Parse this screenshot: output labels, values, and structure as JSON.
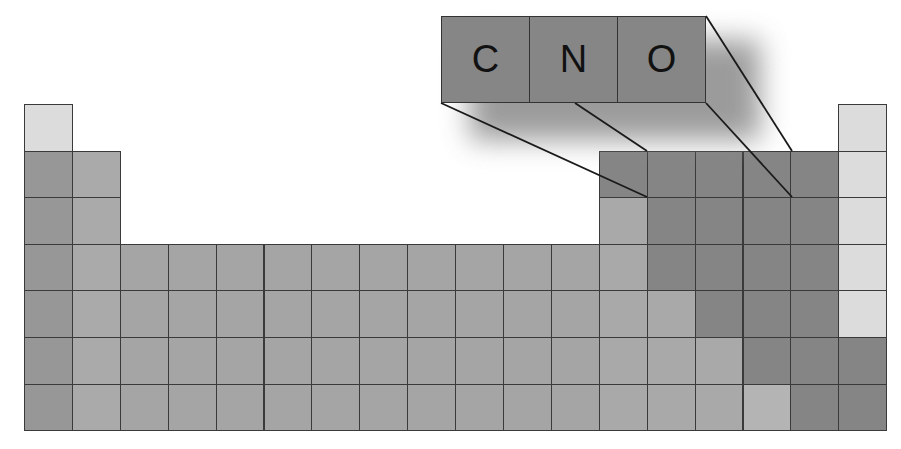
{
  "diagram": {
    "title": "",
    "colors": {
      "light": "#dcdcdc",
      "alkali": "#979797",
      "alkaline_earth": "#aaaaaa",
      "transition": "#a5a5a5",
      "medium": "#a9a9a9",
      "dark": "#858585",
      "callout": "#868686"
    },
    "grid": {
      "left": 24,
      "top_row1": 104,
      "col_width": 47.9,
      "row_height": 46.6,
      "rows": 7,
      "cols": 18
    },
    "cells": [
      {
        "r": 1,
        "c": 1,
        "shade": "light"
      },
      {
        "r": 1,
        "c": 18,
        "shade": "light"
      },
      {
        "r": 2,
        "c": 1,
        "shade": "alkali"
      },
      {
        "r": 2,
        "c": 2,
        "shade": "alkaline_earth"
      },
      {
        "r": 2,
        "c": 13,
        "shade": "dark"
      },
      {
        "r": 2,
        "c": 14,
        "shade": "dark"
      },
      {
        "r": 2,
        "c": 15,
        "shade": "dark"
      },
      {
        "r": 2,
        "c": 16,
        "shade": "dark"
      },
      {
        "r": 2,
        "c": 17,
        "shade": "dark"
      },
      {
        "r": 2,
        "c": 18,
        "shade": "light"
      },
      {
        "r": 3,
        "c": 1,
        "shade": "alkali"
      },
      {
        "r": 3,
        "c": 2,
        "shade": "alkaline_earth"
      },
      {
        "r": 3,
        "c": 13,
        "shade": "medium"
      },
      {
        "r": 3,
        "c": 14,
        "shade": "dark"
      },
      {
        "r": 3,
        "c": 15,
        "shade": "dark"
      },
      {
        "r": 3,
        "c": 16,
        "shade": "dark"
      },
      {
        "r": 3,
        "c": 17,
        "shade": "dark"
      },
      {
        "r": 3,
        "c": 18,
        "shade": "light"
      },
      {
        "r": 4,
        "c": 1,
        "shade": "alkali"
      },
      {
        "r": 4,
        "c": 2,
        "shade": "alkaline_earth"
      },
      {
        "r": 4,
        "c": 3,
        "shade": "transition"
      },
      {
        "r": 4,
        "c": 4,
        "shade": "transition"
      },
      {
        "r": 4,
        "c": 5,
        "shade": "transition"
      },
      {
        "r": 4,
        "c": 6,
        "shade": "transition"
      },
      {
        "r": 4,
        "c": 7,
        "shade": "transition"
      },
      {
        "r": 4,
        "c": 8,
        "shade": "transition"
      },
      {
        "r": 4,
        "c": 9,
        "shade": "transition"
      },
      {
        "r": 4,
        "c": 10,
        "shade": "transition"
      },
      {
        "r": 4,
        "c": 11,
        "shade": "transition"
      },
      {
        "r": 4,
        "c": 12,
        "shade": "transition"
      },
      {
        "r": 4,
        "c": 13,
        "shade": "medium"
      },
      {
        "r": 4,
        "c": 14,
        "shade": "dark"
      },
      {
        "r": 4,
        "c": 15,
        "shade": "dark"
      },
      {
        "r": 4,
        "c": 16,
        "shade": "dark"
      },
      {
        "r": 4,
        "c": 17,
        "shade": "dark"
      },
      {
        "r": 4,
        "c": 18,
        "shade": "light"
      },
      {
        "r": 5,
        "c": 1,
        "shade": "alkali"
      },
      {
        "r": 5,
        "c": 2,
        "shade": "alkaline_earth"
      },
      {
        "r": 5,
        "c": 3,
        "shade": "transition"
      },
      {
        "r": 5,
        "c": 4,
        "shade": "transition"
      },
      {
        "r": 5,
        "c": 5,
        "shade": "transition"
      },
      {
        "r": 5,
        "c": 6,
        "shade": "transition"
      },
      {
        "r": 5,
        "c": 7,
        "shade": "transition"
      },
      {
        "r": 5,
        "c": 8,
        "shade": "transition"
      },
      {
        "r": 5,
        "c": 9,
        "shade": "transition"
      },
      {
        "r": 5,
        "c": 10,
        "shade": "transition"
      },
      {
        "r": 5,
        "c": 11,
        "shade": "transition"
      },
      {
        "r": 5,
        "c": 12,
        "shade": "transition"
      },
      {
        "r": 5,
        "c": 13,
        "shade": "medium"
      },
      {
        "r": 5,
        "c": 14,
        "shade": "medium"
      },
      {
        "r": 5,
        "c": 15,
        "shade": "dark"
      },
      {
        "r": 5,
        "c": 16,
        "shade": "dark"
      },
      {
        "r": 5,
        "c": 17,
        "shade": "dark"
      },
      {
        "r": 5,
        "c": 18,
        "shade": "light"
      },
      {
        "r": 6,
        "c": 1,
        "shade": "alkali"
      },
      {
        "r": 6,
        "c": 2,
        "shade": "alkaline_earth"
      },
      {
        "r": 6,
        "c": 3,
        "shade": "transition"
      },
      {
        "r": 6,
        "c": 4,
        "shade": "transition"
      },
      {
        "r": 6,
        "c": 5,
        "shade": "transition"
      },
      {
        "r": 6,
        "c": 6,
        "shade": "transition"
      },
      {
        "r": 6,
        "c": 7,
        "shade": "transition"
      },
      {
        "r": 6,
        "c": 8,
        "shade": "transition"
      },
      {
        "r": 6,
        "c": 9,
        "shade": "transition"
      },
      {
        "r": 6,
        "c": 10,
        "shade": "transition"
      },
      {
        "r": 6,
        "c": 11,
        "shade": "transition"
      },
      {
        "r": 6,
        "c": 12,
        "shade": "transition"
      },
      {
        "r": 6,
        "c": 13,
        "shade": "medium"
      },
      {
        "r": 6,
        "c": 14,
        "shade": "medium"
      },
      {
        "r": 6,
        "c": 15,
        "shade": "medium"
      },
      {
        "r": 6,
        "c": 16,
        "shade": "dark"
      },
      {
        "r": 6,
        "c": 17,
        "shade": "dark"
      },
      {
        "r": 6,
        "c": 18,
        "shade": "dark"
      },
      {
        "r": 7,
        "c": 1,
        "shade": "alkali"
      },
      {
        "r": 7,
        "c": 2,
        "shade": "alkaline_earth"
      },
      {
        "r": 7,
        "c": 3,
        "shade": "transition"
      },
      {
        "r": 7,
        "c": 4,
        "shade": "transition"
      },
      {
        "r": 7,
        "c": 5,
        "shade": "transition"
      },
      {
        "r": 7,
        "c": 6,
        "shade": "transition"
      },
      {
        "r": 7,
        "c": 7,
        "shade": "transition"
      },
      {
        "r": 7,
        "c": 8,
        "shade": "transition"
      },
      {
        "r": 7,
        "c": 9,
        "shade": "transition"
      },
      {
        "r": 7,
        "c": 10,
        "shade": "transition"
      },
      {
        "r": 7,
        "c": 11,
        "shade": "transition"
      },
      {
        "r": 7,
        "c": 12,
        "shade": "transition"
      },
      {
        "r": 7,
        "c": 13,
        "shade": "medium"
      },
      {
        "r": 7,
        "c": 14,
        "shade": "medium"
      },
      {
        "r": 7,
        "c": 15,
        "shade": "medium"
      },
      {
        "r": 7,
        "c": 16,
        "shade": "light_medium"
      },
      {
        "r": 7,
        "c": 17,
        "shade": "dark"
      },
      {
        "r": 7,
        "c": 18,
        "shade": "dark"
      }
    ],
    "callout": {
      "elements": [
        "C",
        "N",
        "O"
      ],
      "box": {
        "x": 441,
        "y": 16,
        "w": 265,
        "h": 87
      },
      "lines": [
        {
          "x1": 441,
          "y1": 103,
          "x2": 647,
          "y2": 197
        },
        {
          "x1": 575,
          "y1": 103,
          "x2": 647,
          "y2": 151
        },
        {
          "x1": 706,
          "y1": 103,
          "x2": 792,
          "y2": 197
        },
        {
          "x1": 706,
          "y1": 16,
          "x2": 792,
          "y2": 151
        }
      ]
    }
  }
}
